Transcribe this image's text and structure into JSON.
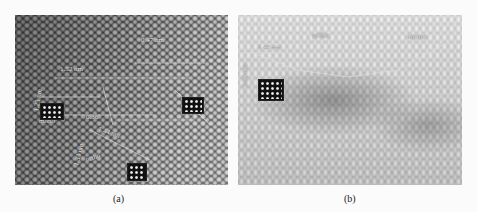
{
  "figure": {
    "panels": [
      {
        "id": "a",
        "caption": "(a)",
        "annotations": {
          "d_047": "0.47 nm",
          "d_152": "1.52 nm",
          "d_123": "1.23 nm",
          "d_036": "0.36",
          "d_144": "1.44 nm",
          "d_133": "1.33 nm",
          "phase_mono": "mono",
          "phase_ortho": "ortho"
        }
      },
      {
        "id": "b",
        "caption": "(b)",
        "annotations": {
          "d_144": "1.44 nm",
          "d_133": "1.33 nm",
          "phase_ortho": "ortho",
          "phase_mono": "mono"
        }
      }
    ],
    "colors": {
      "background": "#fbfbfb",
      "annotation": "#f0f0f0",
      "inset": "#111111"
    }
  }
}
